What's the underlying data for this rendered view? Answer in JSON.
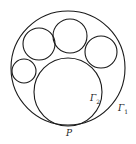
{
  "diagram": {
    "stroke_color": "#1a1a1a",
    "circles": [
      {
        "id": "gamma1",
        "cx": 68,
        "cy": 68,
        "r": 57
      },
      {
        "id": "gamma2",
        "cx": 68,
        "cy": 92,
        "r": 34
      },
      {
        "id": "small-top",
        "cx": 70,
        "cy": 36,
        "r": 17
      },
      {
        "id": "small-upper-left",
        "cx": 39,
        "cy": 44,
        "r": 17
      },
      {
        "id": "small-right",
        "cx": 101,
        "cy": 52,
        "r": 16
      },
      {
        "id": "small-left",
        "cx": 24,
        "cy": 71,
        "r": 12
      }
    ],
    "labels": {
      "gamma2_base": "Γ",
      "gamma2_sub": "2",
      "gamma1_base": "Γ",
      "gamma1_sub": "1",
      "point_p": "P"
    }
  }
}
